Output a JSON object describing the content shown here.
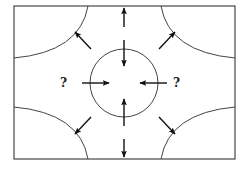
{
  "diagram": {
    "colors": {
      "stroke": "#333333",
      "arrow": "#111111",
      "background": "#ffffff"
    },
    "frame": {
      "x": 14,
      "y": 6,
      "width": 221,
      "height": 153
    },
    "circle": {
      "cx": 124,
      "cy": 83,
      "r": 34
    },
    "labels": [
      {
        "id": "left-question",
        "text": "?",
        "x": 63,
        "y": 86
      },
      {
        "id": "right-question",
        "text": "?",
        "x": 176,
        "y": 86
      }
    ],
    "arrows": [
      {
        "id": "top-outward",
        "direction": "up",
        "from": [
          124,
          27
        ],
        "to": [
          124,
          8
        ]
      },
      {
        "id": "top-inward",
        "direction": "down",
        "from": [
          124,
          40
        ],
        "to": [
          124,
          66
        ]
      },
      {
        "id": "bottom-inward",
        "direction": "up",
        "from": [
          124,
          126
        ],
        "to": [
          124,
          99
        ]
      },
      {
        "id": "bottom-outward",
        "direction": "down",
        "from": [
          124,
          139
        ],
        "to": [
          124,
          157
        ]
      },
      {
        "id": "left-inward",
        "direction": "right",
        "from": [
          82,
          83
        ],
        "to": [
          109,
          83
        ]
      },
      {
        "id": "right-inward",
        "direction": "left",
        "from": [
          167,
          83
        ],
        "to": [
          140,
          83
        ]
      },
      {
        "id": "top-left-outward",
        "direction": "up-left",
        "from": [
          91,
          49
        ],
        "to": [
          75,
          32
        ]
      },
      {
        "id": "top-right-outward",
        "direction": "up-right",
        "from": [
          159,
          49
        ],
        "to": [
          175,
          32
        ]
      },
      {
        "id": "bottom-left-outward",
        "direction": "down-left",
        "from": [
          91,
          117
        ],
        "to": [
          75,
          134
        ]
      },
      {
        "id": "bottom-right-outward",
        "direction": "down-right",
        "from": [
          159,
          117
        ],
        "to": [
          175,
          134
        ]
      }
    ]
  }
}
